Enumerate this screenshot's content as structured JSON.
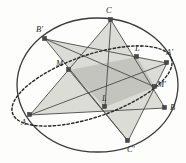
{
  "figure": {
    "kind": "geometry-diagram",
    "width": 186,
    "height": 163,
    "background_color": "#fdfdfc",
    "stroke_color": "#3a3a3a",
    "vertex_marker_color": "#4a4a4a",
    "fill_light": "#d9d9d4",
    "fill_dark": "#c2c2bc",
    "circle": {
      "name": "circumscribed-circle",
      "cx": 97.5,
      "cy": 85.0,
      "rx": 80.5,
      "ry": 67.0,
      "stroke_width": 1.3
    },
    "ellipse": {
      "name": "inscribed-ellipse",
      "cx": 92.0,
      "cy": 86.0,
      "rx": 84.0,
      "ry": 31.0,
      "rotation": -19,
      "dash": "2.4 2.2",
      "stroke_width": 1.4
    },
    "points": [
      {
        "id": "C",
        "label": "C",
        "x": 111,
        "y": 20,
        "lx": 106,
        "ly": 8
      },
      {
        "id": "Bp",
        "label": "B'",
        "x": 45,
        "y": 39,
        "lx": 37,
        "ly": 27
      },
      {
        "id": "Lp",
        "label": "L'",
        "x": 137,
        "y": 57,
        "lx": 136,
        "ly": 46
      },
      {
        "id": "Ap",
        "label": "A'",
        "x": 167,
        "y": 63,
        "lx": 166,
        "ly": 50
      },
      {
        "id": "M",
        "label": "M",
        "x": 69,
        "y": 70,
        "lx": 58,
        "ly": 62
      },
      {
        "id": "Mp",
        "label": "M'",
        "x": 155,
        "y": 87,
        "lx": 157,
        "ly": 82
      },
      {
        "id": "L",
        "label": "L",
        "x": 105,
        "y": 107,
        "lx": 103,
        "ly": 96
      },
      {
        "id": "B",
        "label": "B",
        "x": 165,
        "y": 108,
        "lx": 170,
        "ly": 105
      },
      {
        "id": "A",
        "label": "A",
        "x": 30,
        "y": 115,
        "lx": 22,
        "ly": 119
      },
      {
        "id": "Cp",
        "label": "C'",
        "x": 128,
        "y": 141,
        "lx": 128,
        "ly": 143
      }
    ],
    "triangles": [
      {
        "name": "triangle-A-C-B",
        "vertices": "A,C,B",
        "fill": "#dcdcd7"
      },
      {
        "name": "triangle-Ap-Bp-Cp",
        "vertices": "Ap,Bp,Cp",
        "fill": "#dcdcd7"
      }
    ],
    "quadrilateral": {
      "name": "midpoint-quadrilateral-M-Lp-Mp-L",
      "vertices": "M,Lp,Mp,L",
      "fill": "#c4c4be"
    },
    "segments": [
      {
        "name": "segment-A-C",
        "from": "A",
        "to": "C"
      },
      {
        "name": "segment-C-B",
        "from": "C",
        "to": "B"
      },
      {
        "name": "segment-B-A",
        "from": "B",
        "to": "A"
      },
      {
        "name": "segment-Ap-Bp",
        "from": "Ap",
        "to": "Bp"
      },
      {
        "name": "segment-Bp-Cp",
        "from": "Bp",
        "to": "Cp"
      },
      {
        "name": "segment-Cp-Ap",
        "from": "Cp",
        "to": "Ap"
      },
      {
        "name": "segment-Bp-Mp",
        "from": "Bp",
        "to": "Mp"
      },
      {
        "name": "segment-A-Ap",
        "from": "A",
        "to": "Ap"
      }
    ]
  }
}
